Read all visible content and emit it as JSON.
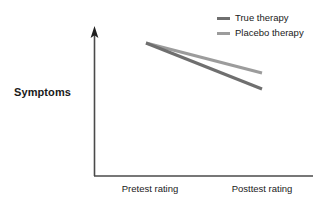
{
  "chart_data": {
    "type": "line",
    "title": "",
    "xlabel": "",
    "ylabel": "Symptoms",
    "categories": [
      "Pretest rating",
      "Posttest rating"
    ],
    "grid": false,
    "legend_position": "top-right",
    "axis_style": "y-axis-with-arrow",
    "series": [
      {
        "name": "True therapy",
        "color": "#6f6f6f",
        "values": [
          100,
          28
        ],
        "points": [
          [
            146,
            43
          ],
          [
            262,
            89
          ]
        ]
      },
      {
        "name": "Placebo therapy",
        "color": "#9c9c9c",
        "values": [
          100,
          55
        ],
        "points": [
          [
            146,
            43
          ],
          [
            262,
            73
          ]
        ]
      }
    ],
    "annotations": []
  },
  "axes": {
    "y_title": "Symptoms",
    "x_tick_labels": {
      "pretest": "Pretest rating",
      "posttest": "Posttest rating"
    },
    "axis_color": "#4a4a4a"
  },
  "legend": {
    "items": [
      {
        "label": "True therapy",
        "color": "#6f6f6f"
      },
      {
        "label": "Placebo therapy",
        "color": "#9c9c9c"
      }
    ]
  }
}
